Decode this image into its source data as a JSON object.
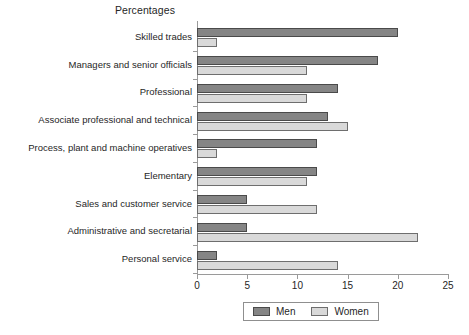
{
  "chart_data": {
    "type": "bar",
    "orientation": "horizontal",
    "title": "Percentages",
    "xlabel": "",
    "ylabel": "",
    "xlim": [
      0,
      25
    ],
    "xticks": [
      0,
      5,
      10,
      15,
      20,
      25
    ],
    "xtick_labels": [
      "0",
      "5",
      "10",
      "15",
      "20",
      "25"
    ],
    "grid": false,
    "legend_position": "bottom",
    "categories": [
      "Skilled trades",
      "Managers and senior officials",
      "Professional",
      "Associate professional and technical",
      "Process, plant and machine operatives",
      "Elementary",
      "Sales and customer service",
      "Administrative and secretarial",
      "Personal service"
    ],
    "series": [
      {
        "name": "Men",
        "color": "#858585",
        "values": [
          20,
          18,
          14,
          13,
          12,
          12,
          5,
          5,
          2
        ]
      },
      {
        "name": "Women",
        "color": "#d9d9d9",
        "values": [
          2,
          11,
          11,
          15,
          2,
          11,
          12,
          22,
          14
        ]
      }
    ]
  },
  "legend": {
    "entries": [
      {
        "label": "Men",
        "color": "#858585",
        "border": "#4a4a4a"
      },
      {
        "label": "Women",
        "color": "#d9d9d9",
        "border": "#6e6e6e"
      }
    ]
  }
}
